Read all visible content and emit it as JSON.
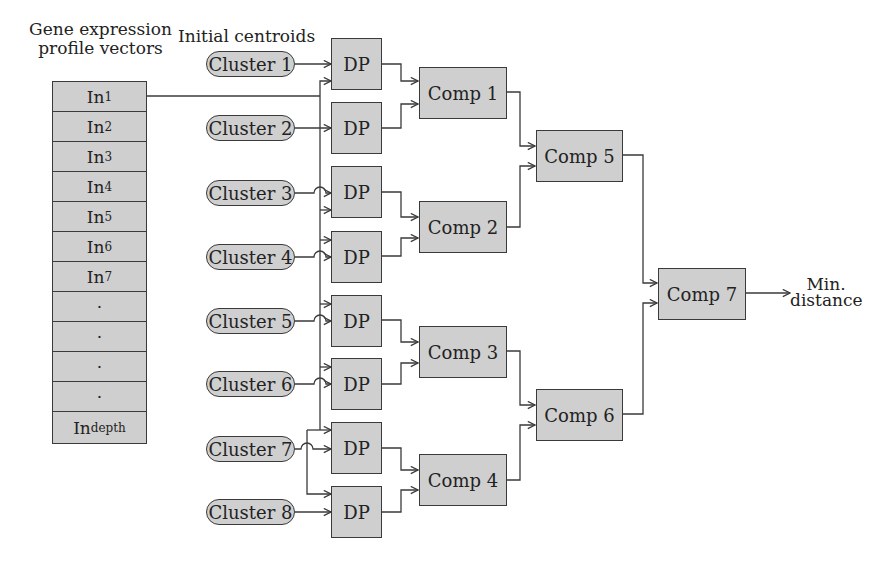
{
  "labels": {
    "vectors_title_line1": "Gene expression",
    "vectors_title_line2": "profile vectors",
    "centroids_title": "Initial centroids",
    "output_line1": "Min.",
    "output_line2": "distance"
  },
  "vectors": [
    {
      "base": "In",
      "sub": "1"
    },
    {
      "base": "In",
      "sub": "2"
    },
    {
      "base": "In",
      "sub": "3"
    },
    {
      "base": "In",
      "sub": "4"
    },
    {
      "base": "In",
      "sub": "5"
    },
    {
      "base": "In",
      "sub": "6"
    },
    {
      "base": "In",
      "sub": "7"
    },
    {
      "base": "·",
      "sub": ""
    },
    {
      "base": "·",
      "sub": ""
    },
    {
      "base": "·",
      "sub": ""
    },
    {
      "base": "·",
      "sub": ""
    },
    {
      "base": "In",
      "sub": "depth"
    }
  ],
  "clusters": [
    "Cluster 1",
    "Cluster 2",
    "Cluster 3",
    "Cluster 4",
    "Cluster 5",
    "Cluster 6",
    "Cluster 7",
    "Cluster 8"
  ],
  "dp_label": "DP",
  "comparators": [
    "Comp 1",
    "Comp 2",
    "Comp 3",
    "Comp 4",
    "Comp 5",
    "Comp 6",
    "Comp 7"
  ],
  "colors": {
    "box_fill": "#cfcfcf",
    "stroke": "#3a3a3a",
    "background": "#ffffff"
  }
}
